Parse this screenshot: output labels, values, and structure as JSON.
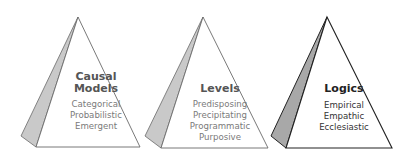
{
  "pyramids": [
    {
      "title_lines": [
        "Causal",
        "Models"
      ],
      "items": [
        "Categorical",
        "Probabilistic",
        "Emergent"
      ],
      "title_color": "#555555",
      "item_color": "#7a7a7a",
      "stroke_color": "#6a6a6a",
      "shade_color": "#c9c9c9",
      "highlighted": false
    },
    {
      "title_lines": [
        "Levels"
      ],
      "items": [
        "Predisposing",
        "Precipitating",
        "Programmatic",
        "Purposive"
      ],
      "title_color": "#555555",
      "item_color": "#7a7a7a",
      "stroke_color": "#6a6a6a",
      "shade_color": "#c9c9c9",
      "highlighted": false
    },
    {
      "title_lines": [
        "Logics"
      ],
      "items": [
        "Empirical",
        "Empathic",
        "Ecclesiastic"
      ],
      "title_color": "#222222",
      "item_color": "#333333",
      "stroke_color": "#222222",
      "shade_color": "#a8a8a8",
      "highlighted": true
    }
  ]
}
